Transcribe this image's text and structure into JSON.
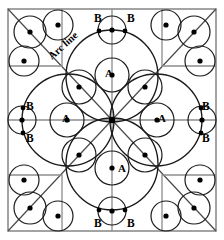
{
  "figure": {
    "title": "",
    "annotation_arc_line": "Arc line",
    "label_a": "A",
    "label_b": "B",
    "colors": {
      "stroke": "#1a1a1a",
      "border": "#8a8a8a",
      "axis": "#8a8a8a",
      "dot": "#000000",
      "background": "#ffffff"
    },
    "geometry": {
      "border": {
        "x": 8,
        "y": 9,
        "width": 208,
        "height": 222
      },
      "center": {
        "x": 112,
        "y": 120
      },
      "petal_arc_radius": 56,
      "small_circle_radius": 17,
      "corner_circle_radius": 16
    },
    "labels": [
      {
        "text": "A",
        "x": 105,
        "y": 77,
        "name": "label-a-top"
      },
      {
        "text": "A",
        "x": 62,
        "y": 122,
        "name": "label-a-left"
      },
      {
        "text": "A",
        "x": 158,
        "y": 122,
        "name": "label-a-right"
      },
      {
        "text": "A",
        "x": 118,
        "y": 172,
        "name": "label-a-bottom"
      },
      {
        "text": "B",
        "x": 94,
        "y": 22,
        "name": "label-b-top-left"
      },
      {
        "text": "B",
        "x": 127,
        "y": 22,
        "name": "label-b-top-right"
      },
      {
        "text": "B",
        "x": 94,
        "y": 227,
        "name": "label-b-bottom-left"
      },
      {
        "text": "B",
        "x": 127,
        "y": 227,
        "name": "label-b-bottom-right"
      },
      {
        "text": "B",
        "x": 26,
        "y": 110,
        "name": "label-b-left-upper"
      },
      {
        "text": "B",
        "x": 26,
        "y": 142,
        "name": "label-b-left-lower"
      },
      {
        "text": "B",
        "x": 202,
        "y": 110,
        "name": "label-b-right-upper"
      },
      {
        "text": "B",
        "x": 202,
        "y": 142,
        "name": "label-b-right-lower"
      }
    ],
    "circles_axis": [
      {
        "cx": 112,
        "cy": 75,
        "r": 17,
        "name": "circle-a-top"
      },
      {
        "cx": 67,
        "cy": 120,
        "r": 17,
        "name": "circle-a-left"
      },
      {
        "cx": 157,
        "cy": 120,
        "r": 17,
        "name": "circle-a-right"
      },
      {
        "cx": 112,
        "cy": 168,
        "r": 17,
        "name": "circle-a-bottom"
      }
    ],
    "circles_diagonal": [
      {
        "cx": 79,
        "cy": 87,
        "r": 17,
        "name": "circle-diag-tl"
      },
      {
        "cx": 145,
        "cy": 87,
        "r": 17,
        "name": "circle-diag-tr"
      },
      {
        "cx": 79,
        "cy": 155,
        "r": 17,
        "name": "circle-diag-bl"
      },
      {
        "cx": 145,
        "cy": 155,
        "r": 17,
        "name": "circle-diag-br"
      }
    ],
    "circles_edge_b": [
      {
        "cx": 112,
        "cy": 30,
        "r": 14,
        "name": "circle-b-top"
      },
      {
        "cx": 112,
        "cy": 211,
        "r": 14,
        "name": "circle-b-bottom"
      },
      {
        "cx": 22,
        "cy": 120,
        "r": 14,
        "name": "circle-b-left"
      },
      {
        "cx": 202,
        "cy": 120,
        "r": 14,
        "name": "circle-b-right"
      }
    ],
    "circles_corner": [
      {
        "cx": 30,
        "cy": 32,
        "r": 16,
        "name": "circle-corner-tl-diag"
      },
      {
        "cx": 58,
        "cy": 25,
        "r": 15,
        "name": "circle-corner-tl-top"
      },
      {
        "cx": 24,
        "cy": 61,
        "r": 15,
        "name": "circle-corner-tl-left"
      },
      {
        "cx": 194,
        "cy": 32,
        "r": 16,
        "name": "circle-corner-tr-diag"
      },
      {
        "cx": 166,
        "cy": 25,
        "r": 15,
        "name": "circle-corner-tr-top"
      },
      {
        "cx": 200,
        "cy": 61,
        "r": 15,
        "name": "circle-corner-tr-right"
      },
      {
        "cx": 30,
        "cy": 208,
        "r": 16,
        "name": "circle-corner-bl-diag"
      },
      {
        "cx": 58,
        "cy": 216,
        "r": 15,
        "name": "circle-corner-bl-bottom"
      },
      {
        "cx": 24,
        "cy": 180,
        "r": 15,
        "name": "circle-corner-bl-left"
      },
      {
        "cx": 194,
        "cy": 208,
        "r": 16,
        "name": "circle-corner-br-diag"
      },
      {
        "cx": 166,
        "cy": 216,
        "r": 15,
        "name": "circle-corner-br-bottom"
      },
      {
        "cx": 200,
        "cy": 180,
        "r": 15,
        "name": "circle-corner-br-right"
      }
    ],
    "dots": [
      {
        "cx": 112,
        "cy": 120,
        "r": 3.2,
        "name": "dot-center"
      },
      {
        "cx": 112,
        "cy": 75,
        "r": 2.6,
        "name": "dot-a-top"
      },
      {
        "cx": 67,
        "cy": 120,
        "r": 2.6,
        "name": "dot-a-left"
      },
      {
        "cx": 157,
        "cy": 120,
        "r": 2.6,
        "name": "dot-a-right"
      },
      {
        "cx": 112,
        "cy": 168,
        "r": 2.6,
        "name": "dot-a-bottom"
      },
      {
        "cx": 79,
        "cy": 87,
        "r": 2.6,
        "name": "dot-diag-tl"
      },
      {
        "cx": 145,
        "cy": 87,
        "r": 2.6,
        "name": "dot-diag-tr"
      },
      {
        "cx": 79,
        "cy": 155,
        "r": 2.6,
        "name": "dot-diag-bl"
      },
      {
        "cx": 145,
        "cy": 155,
        "r": 2.6,
        "name": "dot-diag-br"
      },
      {
        "cx": 112,
        "cy": 30,
        "r": 2.6,
        "name": "dot-b-top-center"
      },
      {
        "cx": 99,
        "cy": 31,
        "r": 2.4,
        "name": "dot-b-top-left"
      },
      {
        "cx": 125,
        "cy": 31,
        "r": 2.4,
        "name": "dot-b-top-right"
      },
      {
        "cx": 112,
        "cy": 211,
        "r": 2.6,
        "name": "dot-b-bottom-center"
      },
      {
        "cx": 99,
        "cy": 210,
        "r": 2.4,
        "name": "dot-b-bottom-left"
      },
      {
        "cx": 125,
        "cy": 210,
        "r": 2.4,
        "name": "dot-b-bottom-right"
      },
      {
        "cx": 22,
        "cy": 120,
        "r": 2.6,
        "name": "dot-b-left-center"
      },
      {
        "cx": 23,
        "cy": 108,
        "r": 2.4,
        "name": "dot-b-left-upper"
      },
      {
        "cx": 23,
        "cy": 133,
        "r": 2.4,
        "name": "dot-b-left-lower"
      },
      {
        "cx": 202,
        "cy": 120,
        "r": 2.6,
        "name": "dot-b-right-center"
      },
      {
        "cx": 201,
        "cy": 108,
        "r": 2.4,
        "name": "dot-b-right-upper"
      },
      {
        "cx": 201,
        "cy": 133,
        "r": 2.4,
        "name": "dot-b-right-lower"
      },
      {
        "cx": 30,
        "cy": 32,
        "r": 2.6,
        "name": "dot-corner-tl-diag"
      },
      {
        "cx": 58,
        "cy": 25,
        "r": 2.6,
        "name": "dot-corner-tl-top"
      },
      {
        "cx": 24,
        "cy": 61,
        "r": 2.6,
        "name": "dot-corner-tl-left"
      },
      {
        "cx": 194,
        "cy": 32,
        "r": 2.6,
        "name": "dot-corner-tr-diag"
      },
      {
        "cx": 166,
        "cy": 25,
        "r": 2.6,
        "name": "dot-corner-tr-top"
      },
      {
        "cx": 200,
        "cy": 61,
        "r": 2.6,
        "name": "dot-corner-tr-right"
      },
      {
        "cx": 30,
        "cy": 208,
        "r": 2.6,
        "name": "dot-corner-bl-diag"
      },
      {
        "cx": 58,
        "cy": 216,
        "r": 2.6,
        "name": "dot-corner-bl-bottom"
      },
      {
        "cx": 24,
        "cy": 180,
        "r": 2.6,
        "name": "dot-corner-bl-left"
      },
      {
        "cx": 194,
        "cy": 208,
        "r": 2.6,
        "name": "dot-corner-br-diag"
      },
      {
        "cx": 166,
        "cy": 216,
        "r": 2.6,
        "name": "dot-corner-br-bottom"
      },
      {
        "cx": 200,
        "cy": 180,
        "r": 2.6,
        "name": "dot-corner-br-right"
      }
    ]
  }
}
